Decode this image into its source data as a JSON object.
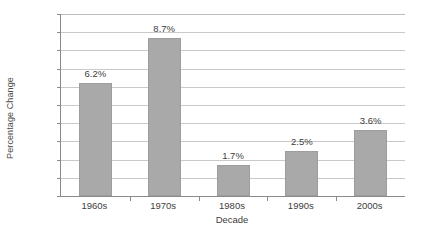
{
  "chart_data": {
    "type": "bar",
    "title": "",
    "xlabel": "Decade",
    "ylabel": "Percentage Change",
    "categories": [
      "1960s",
      "1970s",
      "1980s",
      "1990s",
      "2000s"
    ],
    "values": [
      6.2,
      8.7,
      1.7,
      2.5,
      3.6
    ],
    "value_labels": [
      "6.2%",
      "8.7%",
      "1.7%",
      "2.5%",
      "3.6%"
    ],
    "ylim": [
      0,
      10
    ],
    "ytick_values": [
      10,
      9,
      8,
      7,
      6,
      5,
      4,
      3,
      2,
      1,
      0
    ],
    "ytick_labels": [
      "10%",
      "9%",
      "8%",
      "7%",
      "6%",
      "5%",
      "4%",
      "3%",
      "2%",
      "1%",
      "0%"
    ],
    "grid": true,
    "legend": false,
    "legend_position": "none",
    "series": [
      {
        "name": "Percentage Change",
        "values": [
          6.2,
          8.7,
          1.7,
          2.5,
          3.6
        ]
      }
    ],
    "colors": {
      "bar_fill": "#a9a9a9",
      "bar_border": "#9d9d9d",
      "gridline": "#c9c9c9",
      "axis": "#8a8a8a",
      "text": "#3d3d3d",
      "background": "#ffffff"
    }
  }
}
